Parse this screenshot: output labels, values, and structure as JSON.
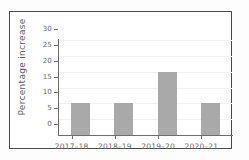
{
  "chart_data": {
    "type": "bar",
    "title": "",
    "xlabel": "",
    "ylabel": "Percentage increase",
    "categories": [
      "2017–18",
      "2018–19",
      "2019–20",
      "2020–21"
    ],
    "values": [
      10,
      10,
      20,
      10
    ],
    "ylim": [
      0,
      30
    ],
    "yticks": [
      0,
      5,
      10,
      15,
      20,
      25,
      30
    ],
    "ytick_labels": [
      "0",
      "5",
      "10",
      "15",
      "20",
      "25",
      "30"
    ],
    "grid": true,
    "legend": false,
    "bar_color": "#a9a9a9",
    "axis_color": "#6d6d6d",
    "grid_color": "#f1f1f1",
    "frame_color": "#4a4a4a",
    "background_color": "#ffffff"
  }
}
